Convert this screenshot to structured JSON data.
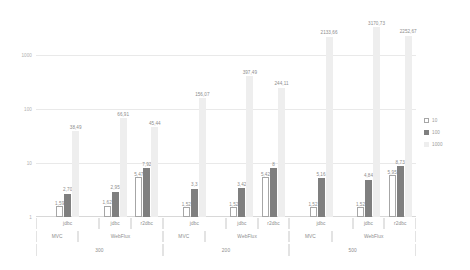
{
  "chart_data": {
    "type": "bar",
    "title": "",
    "subtitle": "",
    "xlabel": "",
    "ylabel": "",
    "yscale": "log",
    "ylim": [
      1,
      4000
    ],
    "y_ticks": [
      "1",
      "10",
      "100",
      "1000"
    ],
    "grid": true,
    "legend_position": "right",
    "categories": [
      "jdbc",
      "jdbc",
      "r2dbc",
      "jdbc",
      "jdbc",
      "r2dbc",
      "jdbc",
      "jdbc",
      "r2dbc"
    ],
    "group_level2": [
      "MVC",
      "WebFlux",
      "MVC",
      "WebFlux",
      "MVC",
      "WebFlux"
    ],
    "group_level1": [
      "300",
      "200",
      "500"
    ],
    "series": [
      {
        "name": "10",
        "values": [
          1.59,
          1.62,
          5.47,
          1.52,
          1.52,
          5.42,
          1.52,
          1.52,
          5.95
        ],
        "labels": [
          "1,59",
          "1,62",
          "5,47",
          "1,52",
          "1,52",
          "5,42",
          "1,52",
          "1,52",
          "5,95"
        ],
        "color": "#ffffff"
      },
      {
        "name": "100",
        "values": [
          2.7,
          2.95,
          7.92,
          3.3,
          3.42,
          8,
          5.16,
          4.84,
          8.73
        ],
        "labels": [
          "2,70",
          "2,95",
          "7,92",
          "3,3",
          "3,42",
          "8",
          "5,16",
          "4,84",
          "8,73"
        ],
        "color": "#7f7f7f"
      },
      {
        "name": "1000",
        "values": [
          38.49,
          66.91,
          45.44,
          156.07,
          397.49,
          244.11,
          2133.66,
          3170.73,
          2252.67
        ],
        "labels": [
          "38,49",
          "66,91",
          "45,44",
          "156,07",
          "397,49",
          "244,11",
          "2133,66",
          "3170,73",
          "2252,67"
        ],
        "color": "#eeeeee"
      }
    ]
  },
  "legend": {
    "items": [
      {
        "label": "10",
        "swatch": "s10"
      },
      {
        "label": "100",
        "swatch": "s100"
      },
      {
        "label": "1000",
        "swatch": "s1000"
      }
    ]
  },
  "axis": {
    "y_ticks": [
      {
        "label": "1000",
        "value": 1000
      },
      {
        "label": "100",
        "value": 100
      },
      {
        "label": "10",
        "value": 10
      },
      {
        "label": "1",
        "value": 1
      }
    ]
  }
}
